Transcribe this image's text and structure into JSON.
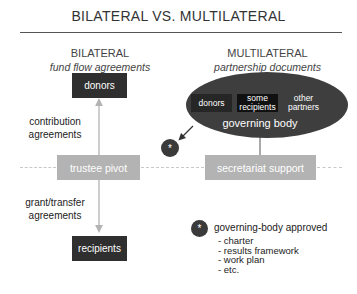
{
  "title": "BILATERAL VS. MULTILATERAL",
  "bilateral": {
    "heading": "BILATERAL",
    "subheading": "fund flow agreements",
    "top_box": "donors",
    "middle_box": "trustee pivot",
    "bottom_box": "recipients",
    "upper_arrow_label": [
      "contribution",
      "agreements"
    ],
    "lower_arrow_label": [
      "grant/transfer",
      "agreements"
    ]
  },
  "multilateral": {
    "heading": "MULTILATERAL",
    "subheading": "partnership documents",
    "ellipse": {
      "members": [
        {
          "label": [
            "donors"
          ]
        },
        {
          "label": [
            "some",
            "recipients"
          ]
        },
        {
          "label": [
            "other",
            "partners"
          ]
        }
      ],
      "caption": "governing body"
    },
    "support_box": "secretariat support",
    "marker_symbol": "*"
  },
  "legend": {
    "symbol": "*",
    "title": "governing-body approved",
    "items": [
      "- charter",
      "- results framework",
      "- work plan",
      "- etc."
    ]
  },
  "colors": {
    "dark_box": "#2f2f2f",
    "grey_box": "#b3b3b3",
    "ellipse": "#3e3e3e",
    "dashed_line": "#c8c8c8"
  }
}
